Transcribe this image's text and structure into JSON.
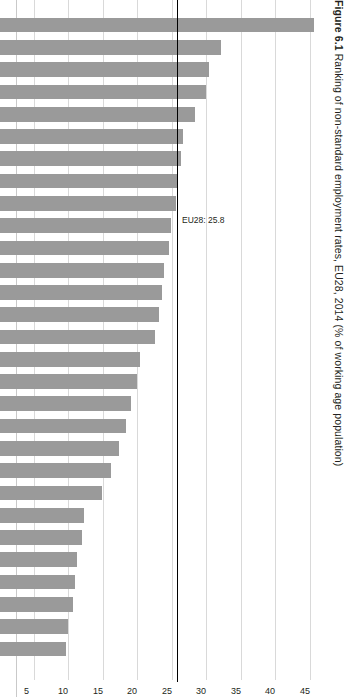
{
  "figure": {
    "number": "Figure 6.1",
    "title": "Figure 6.1 Ranking of non-standard employment rates, EU28, 2014 (% of working age population)",
    "title_bold_part": "Figure 6.1",
    "title_rest": " Ranking of non-standard employment rates, EU28, 2014 (% of working age population)"
  },
  "colors": {
    "bar_fill": "#9a9a9a",
    "gridline": "#d9d9d9",
    "reference_line": "#000000",
    "text": "#231f20",
    "background": "#ffffff"
  },
  "annotation": {
    "eu28_label": "EU28: 25.8",
    "eu28_value": 25.8
  },
  "chart_data": {
    "type": "bar",
    "orientation": "horizontal-rotated",
    "title": "Figure 6.1 Ranking of non-standard employment rates, EU28, 2014 (% of working age population)",
    "xlabel": "",
    "ylabel": "% of working age population",
    "ylim": [
      0,
      45
    ],
    "axis_ticks": [
      45,
      40,
      35,
      30,
      25,
      20,
      15,
      10,
      5,
      0
    ],
    "axis_direction": "descending",
    "grid": true,
    "legend": "none",
    "reference_lines": [
      {
        "label": "EU28: 25.8",
        "value": 25.8
      }
    ],
    "categories": [
      "NL",
      "DE",
      "AT",
      "SE",
      "UK",
      "DK",
      "PL",
      "EU",
      "ES",
      "BE",
      "IT",
      "FI",
      "FR",
      "IE",
      "CY",
      "PT",
      "GR",
      "LU",
      "MT",
      "CZ",
      "SI",
      "HR",
      "HU",
      "SK",
      "RO",
      "EE",
      "LT",
      "LV",
      "BG"
    ],
    "values": [
      45.5,
      32.0,
      30.2,
      29.8,
      28.2,
      26.5,
      26.2,
      25.8,
      25.5,
      24.8,
      24.5,
      23.8,
      23.5,
      23.0,
      22.5,
      20.2,
      19.8,
      19.0,
      18.2,
      17.2,
      16.0,
      14.8,
      12.2,
      11.8,
      11.2,
      10.8,
      10.5,
      9.8,
      9.5
    ],
    "value_suffix": "%",
    "series_name": "Non-standard employment rate"
  }
}
